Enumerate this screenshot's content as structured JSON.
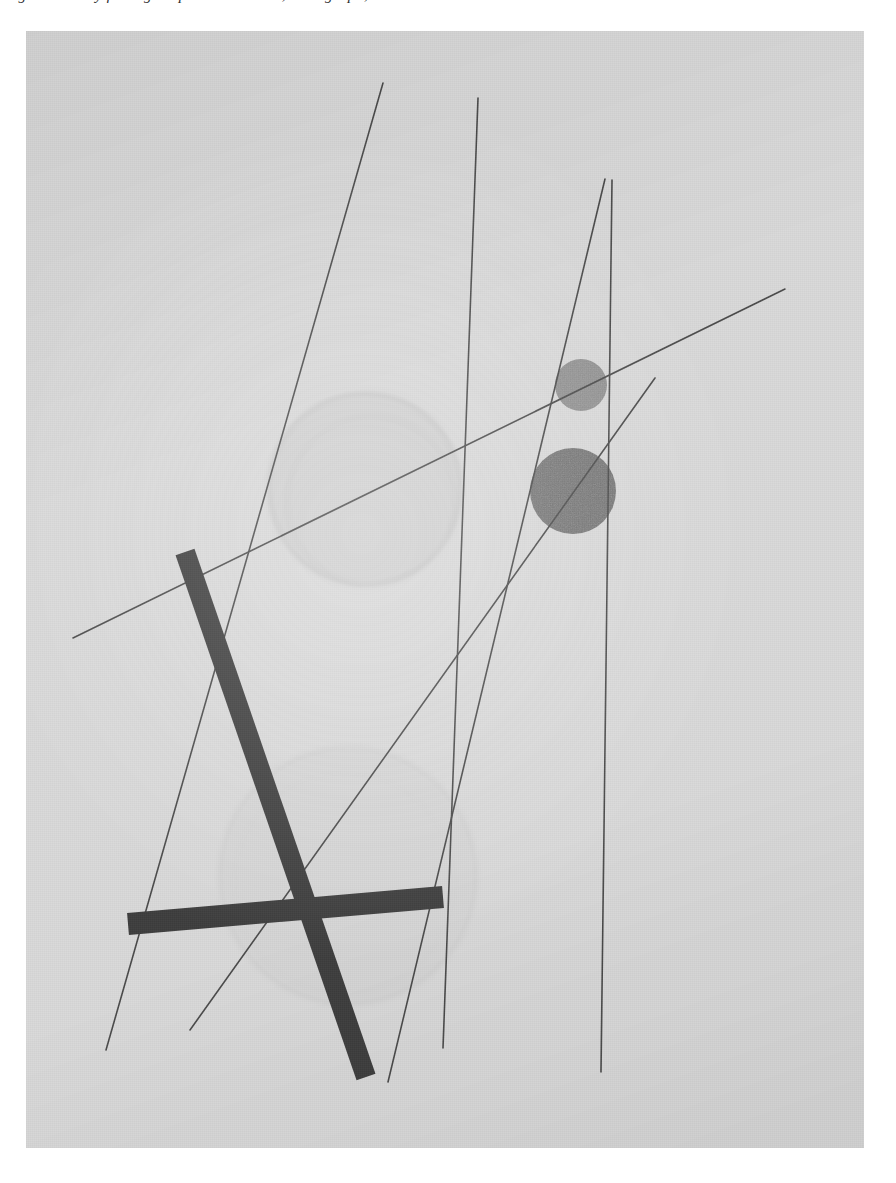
{
  "page": {
    "width": 896,
    "height": 1183,
    "background_color": "#ffffff"
  },
  "caption": {
    "text": "Fig. 8 — Study for Light-Space Modulator, Lithograph, 1923"
  },
  "plate": {
    "name": "abstract-constructivist-composition",
    "x": 26,
    "y": 31,
    "width": 838,
    "height": 1117,
    "paper_color": "#d9d9d9",
    "ink_color": "#3a3a3a",
    "thin_line_color": "#4c4c4c"
  },
  "artwork": {
    "title": "Abstract constructivist composition",
    "medium_note": "photographic plate reproduction",
    "colors": {
      "paper": "#d9d9d9",
      "thin_line": "#4a4a4a",
      "heavy_bar": "#3d3d3d",
      "disc_light": "#8f8f8f",
      "disc_dark": "#6f6f6f",
      "ghost_circle_fill": "#cdcdcd",
      "ghost_circle_stroke": "#bdbdbd"
    },
    "ghost_circles": [
      {
        "name": "large-ghost-circle-upper",
        "cx": 339,
        "cy": 458,
        "r": 96,
        "fill": "#cfcfcf",
        "stroke": "#bcbcbc",
        "opacity": 0.55
      },
      {
        "name": "large-ghost-circle-lower",
        "cx": 322,
        "cy": 845,
        "r": 128,
        "fill": "#d2d2d2",
        "stroke": "#c6c6c6",
        "opacity": 0.42
      }
    ],
    "discs": [
      {
        "name": "small-light-disc",
        "cx": 555,
        "cy": 354,
        "r": 26,
        "fill": "#8d8d8d"
      },
      {
        "name": "large-dark-disc",
        "cx": 547,
        "cy": 460,
        "r": 43,
        "fill": "#6e6e6e"
      }
    ],
    "thin_lines": [
      {
        "name": "thin-line-steep-left",
        "x1": 357,
        "y1": 52,
        "x2": 80,
        "y2": 1019,
        "width": 1.6
      },
      {
        "name": "thin-line-steep-center",
        "x1": 452,
        "y1": 67,
        "x2": 417,
        "y2": 1017,
        "width": 1.6
      },
      {
        "name": "thin-line-steep-right-inner",
        "x1": 579,
        "y1": 148,
        "x2": 362,
        "y2": 1051,
        "width": 1.6
      },
      {
        "name": "thin-line-steep-right-outer",
        "x1": 586,
        "y1": 149,
        "x2": 575,
        "y2": 1041,
        "width": 1.6
      },
      {
        "name": "thin-line-shallow-diagonal",
        "x1": 47,
        "y1": 607,
        "x2": 759,
        "y2": 258,
        "width": 1.6
      },
      {
        "name": "thin-line-short-diagonal",
        "x1": 164,
        "y1": 999,
        "x2": 629,
        "y2": 347,
        "width": 1.6
      }
    ],
    "heavy_bars": [
      {
        "name": "heavy-bar-diagonal",
        "x1": 159,
        "y1": 521,
        "x2": 340,
        "y2": 1046,
        "width": 20
      },
      {
        "name": "heavy-bar-horizontal",
        "x1": 102,
        "y1": 893,
        "x2": 417,
        "y2": 866,
        "width": 22
      }
    ]
  }
}
